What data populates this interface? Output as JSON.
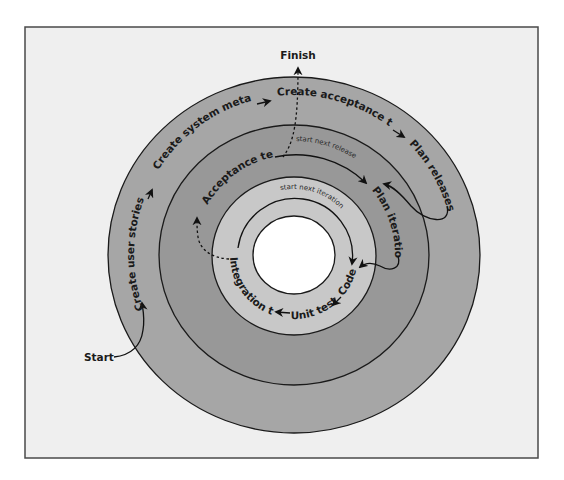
{
  "diagram": {
    "type": "concentric-loops",
    "colors": {
      "background": "#efefef",
      "frame_border": "#4a4a4a",
      "outer_ring": "#a6a6a6",
      "middle_ring": "#989898",
      "inner_ring": "#c8c8c8",
      "core": "#ffffff"
    },
    "endpoints": {
      "start": "Start",
      "finish": "Finish"
    },
    "release_loop": {
      "steps": [
        "Create user stories",
        "Create system metaphor",
        "Create acceptance tests",
        "Plan releases"
      ]
    },
    "iteration_loop": {
      "steps": [
        "Acceptance tests",
        "Plan iterations"
      ],
      "return_label": "start next release"
    },
    "development_loop": {
      "steps": [
        "Code",
        "Unit test",
        "Integration test"
      ],
      "return_label": "start next iteration"
    }
  }
}
